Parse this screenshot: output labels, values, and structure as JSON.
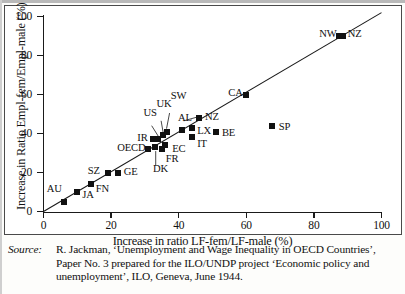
{
  "figure": {
    "xlabel": "Increase in ratio LF-fem/LF-male (%)",
    "ylabel": "Increase in Ratio Empl-fem/Empl-male (%)"
  },
  "source": {
    "label": "Source:",
    "line1": "R. Jackman, ‘Unemployment and Wage Inequality in OECD Countries’,",
    "line2": "Paper No. 3 prepared for the ILO/UNDP project ‘Economic policy and",
    "line3": "unemployment’, ILO, Geneva, June 1944."
  },
  "chart_data": {
    "type": "scatter",
    "title": "",
    "xlabel": "Increase in ratio LF-fem/LF-male (%)",
    "ylabel": "Increase in Ratio Empl-fem/Empl-male (%)",
    "xlim": [
      0,
      100
    ],
    "ylim": [
      0,
      100
    ],
    "xticks": [
      0,
      20,
      40,
      60,
      80,
      100
    ],
    "yticks": [
      0,
      20,
      40,
      60,
      80,
      100
    ],
    "grid": false,
    "legend": false,
    "reference_line": {
      "name": "45-degree line",
      "from": [
        0,
        0
      ],
      "to": [
        100,
        102
      ]
    },
    "points": [
      {
        "label": "AU",
        "x": 6,
        "y": 5,
        "lx": -17,
        "ly": -13
      },
      {
        "label": "JA",
        "x": 10,
        "y": 10,
        "lx": 5,
        "ly": 3
      },
      {
        "label": "FN",
        "x": 14,
        "y": 14,
        "lx": 5,
        "ly": 5
      },
      {
        "label": "SZ",
        "x": 19,
        "y": 20,
        "lx": -20,
        "ly": -2
      },
      {
        "label": "GE",
        "x": 22,
        "y": 20,
        "lx": 6,
        "ly": -1
      },
      {
        "label": "OECD",
        "x": 31,
        "y": 32,
        "lx": -31,
        "ly": -1
      },
      {
        "label": "DK",
        "x": 33,
        "y": 33,
        "lx": -2,
        "ly": 22
      },
      {
        "label": "IR",
        "x": 32.5,
        "y": 37,
        "lx": -16,
        "ly": -1
      },
      {
        "label": "US",
        "x": 34,
        "y": 37,
        "lx": -15,
        "ly": -26
      },
      {
        "label": "FR",
        "x": 35,
        "y": 32,
        "lx": 4,
        "ly": 10
      },
      {
        "label": "UK",
        "x": 35.5,
        "y": 39,
        "lx": -7,
        "ly": -31
      },
      {
        "label": "EC",
        "x": 36,
        "y": 34,
        "lx": 7,
        "ly": 4
      },
      {
        "label": "SW",
        "x": 36.5,
        "y": 41,
        "lx": 4,
        "ly": -36
      },
      {
        "label": "AL",
        "x": 41,
        "y": 42,
        "lx": -4,
        "ly": -12
      },
      {
        "label": "IT",
        "x": 44,
        "y": 38,
        "lx": 5,
        "ly": 7
      },
      {
        "label": "LX",
        "x": 44,
        "y": 43,
        "lx": 5,
        "ly": 3
      },
      {
        "label": "NZ",
        "x": 46,
        "y": 48,
        "lx": 6,
        "ly": -1
      },
      {
        "label": "BE",
        "x": 51,
        "y": 41,
        "lx": 6,
        "ly": 1
      },
      {
        "label": "CA",
        "x": 60,
        "y": 60,
        "lx": -18,
        "ly": -2
      },
      {
        "label": "SP",
        "x": 67.5,
        "y": 44,
        "lx": 7,
        "ly": 1
      },
      {
        "label": "NW",
        "x": 87.5,
        "y": 90,
        "lx": -20,
        "ly": -2
      },
      {
        "label": "NZ2",
        "x": 88.5,
        "y": 90,
        "lx": 5,
        "ly": -2,
        "display": "NZ"
      }
    ],
    "leader_lines": [
      {
        "from_label": "US",
        "x1": 32.0,
        "y1": 44.0,
        "x2": 34.0,
        "y2": 38.5
      },
      {
        "from_label": "UK",
        "x1": 34.8,
        "y1": 46.5,
        "x2": 35.4,
        "y2": 40.5
      },
      {
        "from_label": "SW",
        "x1": 37.3,
        "y1": 50.5,
        "x2": 36.4,
        "y2": 42.5
      },
      {
        "from_label": "AL",
        "x1": 41.5,
        "y1": 46.5,
        "x2": 45.6,
        "y2": 48.5
      },
      {
        "from_label": "DK",
        "x1": 33.2,
        "y1": 23.5,
        "x2": 33.2,
        "y2": 31.0
      }
    ]
  }
}
